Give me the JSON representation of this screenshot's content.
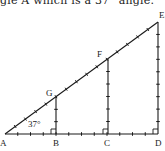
{
  "caption": "gle A which is a 37° angle.",
  "angle_label": "37°",
  "colors": {
    "line": "#1a1a1a",
    "background": "#ffffff"
  },
  "points": {
    "A": {
      "label": "A",
      "x": 5,
      "y": 134
    },
    "B": {
      "label": "B",
      "x": 56,
      "y": 134
    },
    "C": {
      "label": "C",
      "x": 108,
      "y": 134
    },
    "D": {
      "label": "D",
      "x": 158,
      "y": 134
    },
    "E": {
      "label": "E",
      "x": 158,
      "y": 22
    },
    "F": {
      "label": "F",
      "x": 108,
      "y": 59
    },
    "G": {
      "label": "G",
      "x": 56,
      "y": 97
    }
  },
  "segments": [
    {
      "name": "hypotenuse-AE",
      "from": "A",
      "to": "E",
      "divisions": 15
    },
    {
      "name": "base-AD",
      "from": "A",
      "to": "D",
      "divisions": 12
    },
    {
      "name": "leg-GB",
      "from": "B",
      "to": "G",
      "divisions": 3
    },
    {
      "name": "leg-FC",
      "from": "C",
      "to": "F",
      "divisions": 6
    },
    {
      "name": "leg-ED",
      "from": "D",
      "to": "E",
      "divisions": 9
    }
  ],
  "right_angles": [
    "B",
    "C",
    "D"
  ]
}
